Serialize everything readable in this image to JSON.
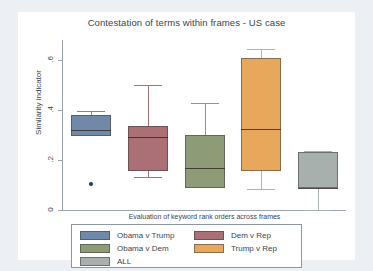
{
  "chart_data": {
    "type": "box",
    "title": "Contestation of terms within frames - US case",
    "xlabel": "Evaluation of keyword rank orders across frames",
    "ylabel": "Similarity indicator",
    "ylim": [
      0,
      0.68
    ],
    "yticks": [
      0,
      0.2,
      0.4,
      0.6
    ],
    "ytick_labels": [
      "0",
      ".2",
      ".4",
      ".6"
    ],
    "grid": false,
    "legend_position": "below-axes",
    "categories": [
      "Obama v Trump",
      "Dem v Rep",
      "Obama v Dem",
      "Trump v Rep",
      "ALL"
    ],
    "colors": [
      "#7089a8",
      "#ab6f76",
      "#8e9b77",
      "#e8a85c",
      "#a8b0ae"
    ],
    "boxes": [
      {
        "name": "Obama v Trump",
        "color": "#7089a8",
        "whisker_high": 0.395,
        "q3": 0.381,
        "median": 0.32,
        "q1": 0.295,
        "whisker_low": 0.295,
        "outliers": [
          0.105
        ]
      },
      {
        "name": "Dem v Rep",
        "color": "#ab6f76",
        "whisker_high": 0.5,
        "q3": 0.335,
        "median": 0.292,
        "q1": 0.157,
        "whisker_low": 0.131,
        "outliers": []
      },
      {
        "name": "Obama v Dem",
        "color": "#8e9b77",
        "whisker_high": 0.428,
        "q3": 0.302,
        "median": 0.167,
        "q1": 0.088,
        "whisker_low": 0.088,
        "outliers": []
      },
      {
        "name": "Trump v Rep",
        "color": "#e8a85c",
        "whisker_high": 0.645,
        "q3": 0.61,
        "median": 0.325,
        "q1": 0.157,
        "whisker_low": 0.085,
        "outliers": []
      },
      {
        "name": "ALL",
        "color": "#a8b0ae",
        "whisker_high": 0.237,
        "q3": 0.232,
        "median": 0.09,
        "q1": 0.088,
        "whisker_low": 0.0,
        "outliers": []
      }
    ]
  },
  "legend": {
    "entries": [
      {
        "label": "Obama v Trump",
        "color": "#7089a8"
      },
      {
        "label": "Dem v Rep",
        "color": "#ab6f76"
      },
      {
        "label": "Obama v Dem",
        "color": "#8e9b77"
      },
      {
        "label": "Trump v Rep",
        "color": "#e8a85c"
      },
      {
        "label": "ALL",
        "color": "#a8b0ae"
      }
    ]
  },
  "axes": {
    "y_tick_labels": [
      "0",
      ".2",
      ".4",
      ".6"
    ]
  }
}
